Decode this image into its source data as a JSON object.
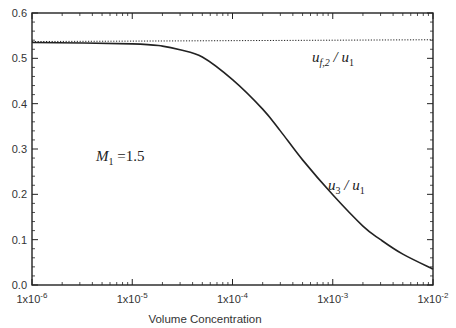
{
  "chart_data": {
    "type": "line",
    "title": "",
    "xlabel": "Volume Concentration",
    "ylabel": "",
    "xscale": "log",
    "xlim": [
      1e-06,
      0.01
    ],
    "ylim": [
      0.0,
      0.6
    ],
    "x_tick_labels": [
      {
        "base": "1x10",
        "exp": "-6",
        "value": 1e-06
      },
      {
        "base": "1x10",
        "exp": "-5",
        "value": 1e-05
      },
      {
        "base": "1x10",
        "exp": "-4",
        "value": 0.0001
      },
      {
        "base": "1x10",
        "exp": "-3",
        "value": 0.001
      },
      {
        "base": "1x10",
        "exp": "-2",
        "value": 0.01
      }
    ],
    "y_tick_labels": [
      "0.0",
      "0.1",
      "0.2",
      "0.3",
      "0.4",
      "0.5",
      "0.6"
    ],
    "y_ticks": [
      0.0,
      0.1,
      0.2,
      0.3,
      0.4,
      0.5,
      0.6
    ],
    "grid": false,
    "series": [
      {
        "name": "u_f,2 / u_1",
        "style": "dotted",
        "x": [
          1e-06,
          0.01
        ],
        "y": [
          0.537,
          0.541
        ]
      },
      {
        "name": "u_3 / u_1",
        "style": "solid",
        "x": [
          1e-06,
          1e-05,
          2e-05,
          3e-05,
          5e-05,
          0.0001,
          0.0002,
          0.0003,
          0.0005,
          0.001,
          0.002,
          0.003,
          0.005,
          0.01
        ],
        "y": [
          0.535,
          0.532,
          0.527,
          0.519,
          0.503,
          0.453,
          0.388,
          0.34,
          0.276,
          0.199,
          0.13,
          0.1,
          0.068,
          0.035
        ]
      }
    ],
    "annotations": [
      {
        "main": "M",
        "sub": "1",
        "rest": " =1.5",
        "at_x": 3e-06,
        "at_y": 0.32
      },
      {
        "main": "u",
        "sub": "f,2",
        "rest": " / u",
        "sub2": "1",
        "series": "u_f,2 / u_1"
      },
      {
        "main": "u",
        "sub": "3",
        "rest": " / u",
        "sub2": "1",
        "series": "u_3 / u_1"
      }
    ]
  }
}
